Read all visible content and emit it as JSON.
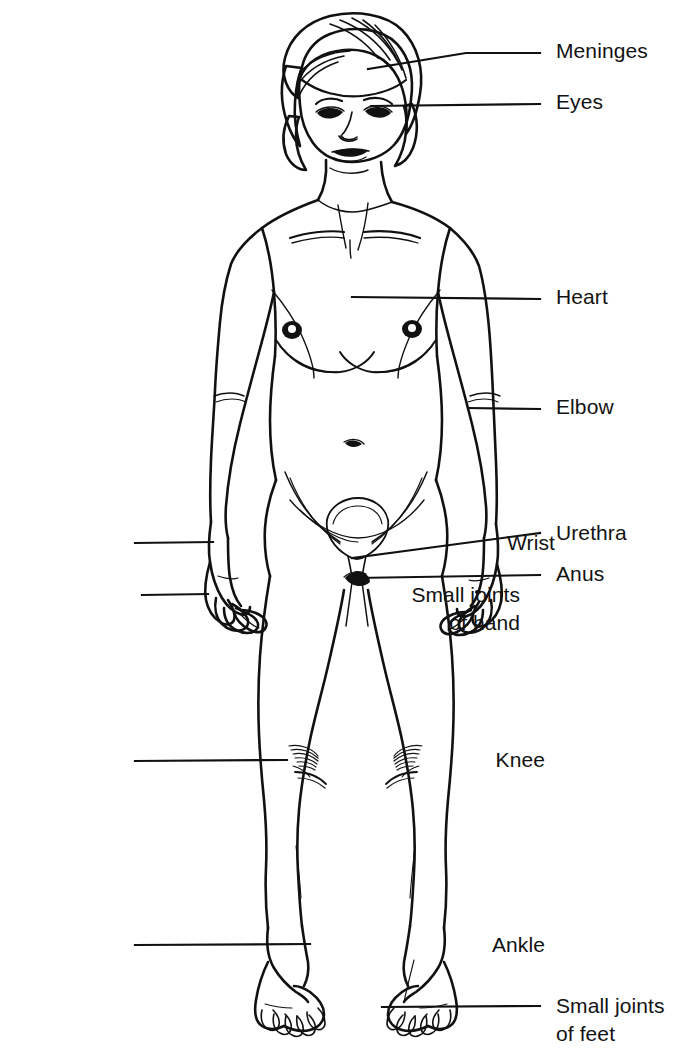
{
  "figure": {
    "ink_color": "#111111",
    "background_color": "#ffffff"
  },
  "labels": [
    {
      "id": "meninges",
      "text": "Meninges",
      "side": "right",
      "text_x": 556,
      "text_y": 37,
      "leader": {
        "points": [
          [
            368,
            69
          ],
          [
            466,
            53
          ],
          [
            540,
            53
          ]
        ]
      }
    },
    {
      "id": "eyes",
      "text": "Eyes",
      "side": "right",
      "text_x": 556,
      "text_y": 88,
      "leader": {
        "points": [
          [
            371,
            106
          ],
          [
            540,
            104
          ]
        ]
      }
    },
    {
      "id": "heart",
      "text": "Heart",
      "side": "right",
      "text_x": 556,
      "text_y": 283,
      "leader": {
        "points": [
          [
            352,
            297
          ],
          [
            540,
            299
          ]
        ]
      }
    },
    {
      "id": "elbow",
      "text": "Elbow",
      "side": "right",
      "text_x": 556,
      "text_y": 393,
      "leader": {
        "points": [
          [
            468,
            408
          ],
          [
            540,
            409
          ]
        ]
      }
    },
    {
      "id": "urethra",
      "text": "Urethra",
      "side": "right",
      "text_x": 556,
      "text_y": 519,
      "leader": {
        "points": [
          [
            352,
            558
          ],
          [
            540,
            533
          ]
        ]
      }
    },
    {
      "id": "anus",
      "text": "Anus",
      "side": "right",
      "text_x": 556,
      "text_y": 560,
      "leader": {
        "points": [
          [
            356,
            578
          ],
          [
            540,
            575
          ]
        ]
      }
    },
    {
      "id": "small-joints-of-feet",
      "text": "Small joints",
      "text2": "of feet",
      "side": "right",
      "text_x": 556,
      "text_y": 992,
      "leader": {
        "points": [
          [
            382,
            1007
          ],
          [
            540,
            1006
          ]
        ]
      }
    },
    {
      "id": "wrist",
      "text": "Wrist",
      "side": "left",
      "text_right": 555,
      "text_y": 529,
      "leader": {
        "points": [
          [
            135,
            543
          ],
          [
            213,
            542
          ]
        ]
      }
    },
    {
      "id": "small-joints-of-hand",
      "text": "Small joints",
      "text2": "of hand",
      "side": "left",
      "text_right": 520,
      "text_y": 581,
      "leader": {
        "points": [
          [
            142,
            595
          ],
          [
            208,
            594
          ]
        ]
      }
    },
    {
      "id": "knee",
      "text": "Knee",
      "side": "left",
      "text_right": 545,
      "text_y": 746,
      "leader": {
        "points": [
          [
            135,
            761
          ],
          [
            287,
            760
          ]
        ]
      }
    },
    {
      "id": "ankle",
      "text": "Ankle",
      "side": "left",
      "text_right": 545,
      "text_y": 931,
      "leader": {
        "points": [
          [
            135,
            945
          ],
          [
            310,
            944
          ]
        ]
      }
    }
  ]
}
